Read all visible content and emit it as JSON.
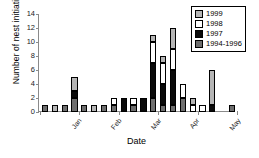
{
  "chart_data": {
    "type": "bar",
    "subtype": "stacked-bar",
    "title": "",
    "xlabel": "Date",
    "ylabel": "Number of nest initiations",
    "ylim": [
      0,
      14
    ],
    "yticks": [
      0,
      2,
      4,
      6,
      8,
      10,
      12,
      14
    ],
    "grid": false,
    "legend_position": "top-right",
    "legend_border": true,
    "categories": [
      "Jan-1",
      "Jan-2",
      "Jan-3",
      "Jan-4",
      "Feb-1",
      "Feb-2",
      "Feb-3",
      "Feb-4",
      "Mar-1",
      "Mar-2",
      "Mar-3",
      "Mar-4",
      "Apr-1",
      "Apr-2",
      "Apr-3",
      "Apr-4",
      "May-1",
      "May-2",
      "May-3",
      "May-4"
    ],
    "month_ticks": [
      "Jan",
      "Feb",
      "Mar",
      "Apr",
      "May"
    ],
    "series": [
      {
        "name": "1994-1996",
        "color": "#6e6e6e",
        "values": [
          1,
          0,
          1,
          2,
          1,
          0,
          1,
          1,
          0,
          1,
          0,
          2,
          1,
          1,
          2,
          0,
          0,
          0,
          0,
          1
        ]
      },
      {
        "name": "1997",
        "color": "#0a0a0a",
        "values": [
          0,
          0,
          0,
          1,
          0,
          0,
          0,
          0,
          2,
          0,
          2,
          5,
          3,
          5,
          0,
          0,
          0,
          1,
          0,
          0
        ]
      },
      {
        "name": "1998",
        "color": "#ffffff",
        "values": [
          0,
          0,
          0,
          0,
          0,
          0,
          0,
          1,
          0,
          1,
          0,
          3,
          3,
          3,
          2,
          1,
          1,
          0,
          0,
          0
        ]
      },
      {
        "name": "1999",
        "color": "#b5b5b5",
        "values": [
          0,
          1,
          0,
          2,
          0,
          1,
          0,
          0,
          0,
          0,
          0,
          1,
          1,
          3,
          0,
          1,
          0,
          5,
          0,
          0
        ]
      }
    ],
    "totals": [
      1,
      1,
      1,
      5,
      1,
      1,
      1,
      2,
      2,
      2,
      2,
      11,
      8,
      12,
      4,
      2,
      1,
      6,
      0,
      1
    ]
  },
  "legend": {
    "items": [
      {
        "label": "1999",
        "swatch": "light-gray"
      },
      {
        "label": "1998",
        "swatch": "white"
      },
      {
        "label": "1997",
        "swatch": "black"
      },
      {
        "label": "1994-1996",
        "swatch": "dark-gray"
      }
    ]
  }
}
